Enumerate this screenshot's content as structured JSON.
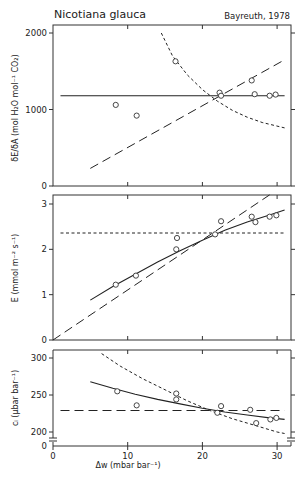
{
  "header": {
    "title": "Nicotiana glauca",
    "subtitle": "Bayreuth, 1978"
  },
  "chart_data": [
    {
      "type": "scatter",
      "panel": "top",
      "ylabel": "δE/δA (mol H₂O mol⁻¹ CO₂)",
      "xlabel": "",
      "xlim": [
        0,
        32
      ],
      "ylim": [
        0,
        2000
      ],
      "yticks": [
        0,
        1000,
        2000
      ],
      "points": [
        {
          "x": 8.4,
          "y": 1060
        },
        {
          "x": 11.2,
          "y": 920
        },
        {
          "x": 16.4,
          "y": 1630
        },
        {
          "x": 22.3,
          "y": 1220
        },
        {
          "x": 22.5,
          "y": 1180
        },
        {
          "x": 26.6,
          "y": 1380
        },
        {
          "x": 27.0,
          "y": 1200
        },
        {
          "x": 29.0,
          "y": 1180
        },
        {
          "x": 29.8,
          "y": 1195
        }
      ],
      "lines": [
        {
          "style": "solid",
          "name": "constant δE/δA",
          "points": [
            [
              1,
              1180
            ],
            [
              31,
              1180
            ]
          ]
        },
        {
          "style": "long-dash",
          "name": "constant ci",
          "points": [
            [
              5,
              230
            ],
            [
              31,
              1650
            ]
          ]
        },
        {
          "style": "short-dash",
          "name": "constant E",
          "points": [
            [
              14.5,
              2000
            ],
            [
              16,
              1700
            ],
            [
              18,
              1450
            ],
            [
              20,
              1260
            ],
            [
              22,
              1110
            ],
            [
              24,
              990
            ],
            [
              26,
              900
            ],
            [
              28,
              830
            ],
            [
              31,
              760
            ]
          ]
        }
      ]
    },
    {
      "type": "scatter",
      "panel": "middle",
      "ylabel": "E (mmol m⁻² s⁻¹)",
      "xlabel": "",
      "xlim": [
        0,
        32
      ],
      "ylim": [
        0,
        3.2
      ],
      "yticks": [
        0,
        1,
        2,
        3
      ],
      "points": [
        {
          "x": 8.4,
          "y": 1.22
        },
        {
          "x": 11.1,
          "y": 1.42
        },
        {
          "x": 16.5,
          "y": 2.0
        },
        {
          "x": 16.6,
          "y": 2.25
        },
        {
          "x": 21.7,
          "y": 2.33
        },
        {
          "x": 22.5,
          "y": 2.62
        },
        {
          "x": 26.6,
          "y": 2.72
        },
        {
          "x": 27.1,
          "y": 2.6
        },
        {
          "x": 29.0,
          "y": 2.72
        },
        {
          "x": 29.9,
          "y": 2.75
        }
      ],
      "lines": [
        {
          "style": "solid",
          "name": "constant δE/δA",
          "points": [
            [
              5,
              0.88
            ],
            [
              8,
              1.18
            ],
            [
              11,
              1.45
            ],
            [
              14,
              1.72
            ],
            [
              17,
              1.97
            ],
            [
              20,
              2.2
            ],
            [
              23,
              2.42
            ],
            [
              26,
              2.6
            ],
            [
              29,
              2.76
            ],
            [
              31,
              2.87
            ]
          ]
        },
        {
          "style": "long-dash",
          "name": "constant ci",
          "points": [
            [
              0,
              0
            ],
            [
              29,
              3.2
            ]
          ]
        },
        {
          "style": "short-dash",
          "name": "constant E",
          "points": [
            [
              1,
              2.36
            ],
            [
              31,
              2.36
            ]
          ]
        }
      ]
    },
    {
      "type": "scatter",
      "panel": "bottom",
      "ylabel": "cᵢ (µbar bar⁻¹)",
      "xlabel": "Δw (mbar bar⁻¹)",
      "xlim": [
        0,
        32
      ],
      "ylim": [
        180,
        320
      ],
      "yticks": [
        200,
        250,
        300
      ],
      "yaxis_break": true,
      "xticks": [
        0,
        10,
        20,
        30
      ],
      "points": [
        {
          "x": 8.6,
          "y": 255
        },
        {
          "x": 11.2,
          "y": 236
        },
        {
          "x": 16.5,
          "y": 252
        },
        {
          "x": 16.5,
          "y": 244
        },
        {
          "x": 22.0,
          "y": 226
        },
        {
          "x": 22.5,
          "y": 235
        },
        {
          "x": 26.4,
          "y": 230
        },
        {
          "x": 27.2,
          "y": 212
        },
        {
          "x": 29.1,
          "y": 217
        },
        {
          "x": 29.9,
          "y": 219
        }
      ],
      "lines": [
        {
          "style": "solid",
          "name": "constant δE/δA",
          "points": [
            [
              5,
              268
            ],
            [
              8,
              259
            ],
            [
              11,
              251
            ],
            [
              14,
              244
            ],
            [
              17,
              238
            ],
            [
              20,
              232
            ],
            [
              23,
              227
            ],
            [
              26,
              223
            ],
            [
              29,
              219
            ],
            [
              31,
              217
            ]
          ]
        },
        {
          "style": "long-dash",
          "name": "constant ci",
          "points": [
            [
              1,
              229
            ],
            [
              31,
              229
            ]
          ]
        },
        {
          "style": "short-dash",
          "name": "constant E",
          "points": [
            [
              6.5,
              306
            ],
            [
              9,
              289
            ],
            [
              12,
              272
            ],
            [
              15,
              257
            ],
            [
              18,
              242
            ],
            [
              21,
              229
            ],
            [
              24,
              218
            ],
            [
              27,
              209
            ],
            [
              30,
              200
            ],
            [
              31,
              198
            ]
          ]
        }
      ]
    }
  ]
}
